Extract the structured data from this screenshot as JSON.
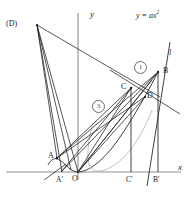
{
  "figure": {
    "kind": "geometry-diagram",
    "ink_color": "#1a1a1a",
    "light_ink_color": "#808080",
    "background": "#ffffff"
  },
  "axes": {
    "x_label": "x",
    "y_label": "y",
    "origin_label": "O",
    "x_axis_y": 172,
    "y_axis_x": 78
  },
  "curve": {
    "equation_label": "y = ax",
    "exponent": "2",
    "vertex": "O"
  },
  "line_label": "l",
  "points": [
    {
      "id": "D-outer",
      "label": "(D)",
      "x": 37,
      "y": 25
    },
    {
      "id": "B",
      "label": "B",
      "x": 158,
      "y": 72
    },
    {
      "id": "C",
      "label": "C",
      "x": 131,
      "y": 88
    },
    {
      "id": "D",
      "label": "D",
      "x": 145,
      "y": 97
    },
    {
      "id": "A",
      "label": "A",
      "x": 57,
      "y": 158
    },
    {
      "id": "A-prime",
      "label": "A'",
      "x": 61,
      "y": 172
    },
    {
      "id": "C-prime",
      "label": "C'",
      "x": 131,
      "y": 172
    },
    {
      "id": "B-prime",
      "label": "B'",
      "x": 158,
      "y": 172
    }
  ],
  "markers": [
    {
      "id": "marker-one",
      "label": "1",
      "x": 139,
      "y": 66
    },
    {
      "id": "marker-three",
      "label": "3",
      "x": 97,
      "y": 105
    }
  ]
}
